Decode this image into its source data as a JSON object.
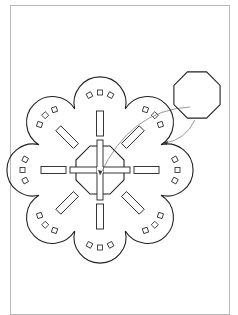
{
  "diagram": {
    "type": "technical-line-drawing",
    "stroke_color": "#222222",
    "frame_color": "#b8b8b8",
    "center": [
      100,
      170
    ],
    "central_octagon_radius": 26,
    "petal_count": 8,
    "petal_distance": 55,
    "petal_radius": 26,
    "detached_octagon": {
      "center": [
        197,
        95
      ],
      "radius": 25
    }
  }
}
